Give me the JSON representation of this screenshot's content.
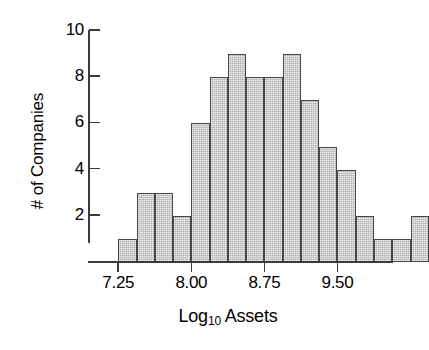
{
  "chart_data": {
    "type": "bar",
    "title": "",
    "subtitle": "",
    "xlabel": "Log10 Assets",
    "xlabel_base": "Log",
    "xlabel_sub": "10",
    "xlabel_rest": " Assets",
    "ylabel": "# of Companies",
    "xlim": [
      7.0625,
      9.875
    ],
    "ylim": [
      0,
      10
    ],
    "grid": false,
    "legend": null,
    "bin_width": 0.1875,
    "bin_edges": [
      7.25,
      7.4375,
      7.625,
      7.8125,
      8.0,
      8.1875,
      8.375,
      8.5625,
      8.75,
      8.9375,
      9.125,
      9.3125,
      9.5,
      9.6875,
      9.875
    ],
    "categories": [
      "7.25-7.44",
      "7.44-7.63",
      "7.63-7.81",
      "7.81-8.00",
      "8.00-8.19",
      "8.19-8.38",
      "8.38-8.56",
      "8.56-8.75",
      "8.75-8.94",
      "8.94-9.13",
      "9.13-9.31",
      "9.31-9.50",
      "9.50-9.69",
      "9.69-9.88",
      "9.88-10.06",
      "10.06-10.25",
      "10.25-10.44"
    ],
    "values": [
      1,
      3,
      3,
      2,
      6,
      8,
      9,
      8,
      8,
      9,
      7,
      5,
      4,
      2,
      1,
      1,
      2
    ],
    "total_count": 75,
    "x_ticks": [
      {
        "label": "7.25",
        "value": 7.25
      },
      {
        "label": "8.00",
        "value": 8.0
      },
      {
        "label": "8.75",
        "value": 8.75
      },
      {
        "label": "9.50",
        "value": 9.5
      }
    ],
    "y_ticks": [
      {
        "label": "2",
        "value": 2
      },
      {
        "label": "4",
        "value": 4
      },
      {
        "label": "6",
        "value": 6
      },
      {
        "label": "8",
        "value": 8
      },
      {
        "label": "10",
        "value": 10
      }
    ],
    "colors": {
      "bar_fill": "#c9c9c9",
      "bar_edge": "#474747",
      "axis": "#3b3b3b",
      "text": "#000000",
      "background": "#ffffff"
    }
  }
}
